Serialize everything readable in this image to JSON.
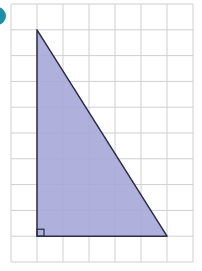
{
  "figure": {
    "type": "right-triangle-on-grid",
    "label_marker_color": "#1f8fa8",
    "grid": {
      "columns": 7,
      "rows": 10,
      "left": 11,
      "top": 4,
      "cell_w": 26,
      "cell_h": 25.8,
      "line_color": "#cfcfcf"
    },
    "triangle": {
      "vertices_grid": [
        [
          1,
          1
        ],
        [
          1,
          9
        ],
        [
          6,
          9
        ]
      ],
      "fill": "#a6a8d8",
      "stroke": "#2b2d44",
      "right_angle_marker": true
    }
  }
}
